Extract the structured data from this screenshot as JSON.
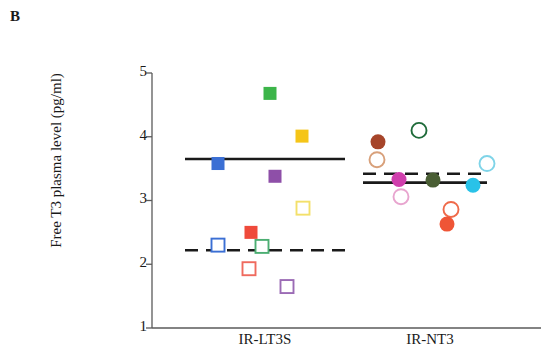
{
  "panel": {
    "label": "B"
  },
  "chart_data": {
    "type": "scatter",
    "title": "",
    "xlabel": "",
    "ylabel": "Free T3 plasma level (pg/ml)",
    "ylim": [
      1,
      5
    ],
    "yticks": [
      1,
      2,
      3,
      4,
      5
    ],
    "ytick_labels": [
      "1",
      "2",
      "3",
      "4",
      "5"
    ],
    "grid": false,
    "legend": false,
    "categories": [
      "IR-LT3S",
      "IR-NT3"
    ],
    "groups": [
      {
        "name": "IR-LT3S",
        "marker": "square",
        "mean_line": {
          "style": "solid",
          "value": 3.65
        },
        "median_line": {
          "style": "dashed",
          "value": 2.22
        },
        "points": [
          {
            "value": 4.68,
            "color": "#3cb54a",
            "fill": "filled"
          },
          {
            "value": 4.01,
            "color": "#f5c518",
            "fill": "filled"
          },
          {
            "value": 3.58,
            "color": "#3b6fd4",
            "fill": "filled"
          },
          {
            "value": 3.38,
            "color": "#8e4fa8",
            "fill": "filled"
          },
          {
            "value": 2.88,
            "color": "#f3e06a",
            "fill": "open"
          },
          {
            "value": 2.5,
            "color": "#ef4a3b",
            "fill": "filled"
          },
          {
            "value": 2.3,
            "color": "#3b6fd4",
            "fill": "open"
          },
          {
            "value": 2.28,
            "color": "#4cae72",
            "fill": "open"
          },
          {
            "value": 1.93,
            "color": "#ef6a5e",
            "fill": "open"
          },
          {
            "value": 1.65,
            "color": "#9b6bb5",
            "fill": "open"
          }
        ]
      },
      {
        "name": "IR-NT3",
        "marker": "circle",
        "mean_line": {
          "style": "solid",
          "value": 3.28
        },
        "median_line": {
          "style": "dashed",
          "value": 3.42
        },
        "points": [
          {
            "value": 4.1,
            "color": "#1f6b3a",
            "fill": "open"
          },
          {
            "value": 3.92,
            "color": "#a6452a",
            "fill": "filled"
          },
          {
            "value": 3.64,
            "color": "#d8a07a",
            "fill": "open"
          },
          {
            "value": 3.58,
            "color": "#7fd4e8",
            "fill": "open"
          },
          {
            "value": 3.33,
            "color": "#d03fad",
            "fill": "filled"
          },
          {
            "value": 3.32,
            "color": "#4a5e34",
            "fill": "filled"
          },
          {
            "value": 3.24,
            "color": "#29c2e8",
            "fill": "filled"
          },
          {
            "value": 3.06,
            "color": "#e8a5cf",
            "fill": "open"
          },
          {
            "value": 2.86,
            "color": "#ef6a4a",
            "fill": "open"
          },
          {
            "value": 2.63,
            "color": "#ef5536",
            "fill": "filled"
          }
        ]
      }
    ]
  },
  "axis": {
    "color": "#5a5a5a",
    "x_labels": [
      "IR-LT3S",
      "IR-NT3"
    ]
  }
}
